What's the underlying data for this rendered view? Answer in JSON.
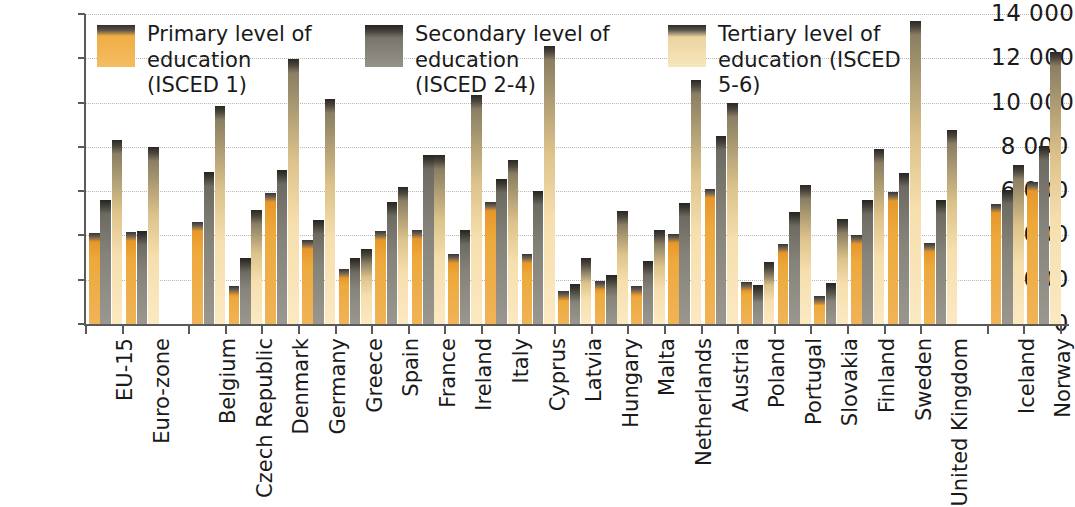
{
  "chart_data": {
    "type": "bar",
    "title": "",
    "subtitle": "",
    "xlabel": "",
    "ylabel": "",
    "ylim": [
      0,
      14000
    ],
    "ytick_step": 2000,
    "ytick_labels": [
      "0",
      "2 000",
      "4 000",
      "6 000",
      "8 000",
      "10 000",
      "12 000",
      "14 000"
    ],
    "ytick_values": [
      0,
      2000,
      4000,
      6000,
      8000,
      10000,
      12000,
      14000
    ],
    "grid": true,
    "legend_position": "top",
    "categories": [
      "EU-15",
      "Euro-zone",
      "Belgium",
      "Czech Republic",
      "Denmark",
      "Germany",
      "Greece",
      "Spain",
      "France",
      "Ireland",
      "Italy",
      "Cyprus",
      "Latvia",
      "Hungary",
      "Malta",
      "Netherlands",
      "Austria",
      "Poland",
      "Portugal",
      "Slovakia",
      "Finland",
      "Sweden",
      "United Kingdom",
      "Iceland",
      "Norway"
    ],
    "group_breaks_after": [
      "Euro-zone",
      "United Kingdom"
    ],
    "series": [
      {
        "name": "Primary level of education (ISCED 1)",
        "key": "primary",
        "color": "#eda93c",
        "values": [
          4100,
          4150,
          4600,
          1700,
          5900,
          3800,
          2500,
          4200,
          4250,
          3150,
          5500,
          3150,
          1500,
          1950,
          1700,
          4050,
          6100,
          1900,
          3600,
          1250,
          4000,
          5950,
          3650,
          5400,
          6400
        ]
      },
      {
        "name": "Secondary level of education (ISCED 2-4)",
        "key": "secondary",
        "color": "#85837a",
        "values": [
          5600,
          4200,
          6850,
          3000,
          6950,
          4700,
          3000,
          5500,
          7650,
          4250,
          6550,
          6000,
          1800,
          2200,
          2850,
          5450,
          8500,
          1750,
          5050,
          1850,
          5600,
          6800,
          5600,
          6050,
          8050
        ]
      },
      {
        "name": "Tertiary level of education (ISCED 5-6)",
        "key": "tertiary",
        "color": "#f6dfae",
        "values": [
          8300,
          8000,
          9850,
          5150,
          11950,
          10150,
          3400,
          6200,
          7650,
          10350,
          7400,
          12550,
          3000,
          5100,
          4250,
          11000,
          10000,
          2800,
          6300,
          4750,
          7900,
          13700,
          8750,
          7200,
          12300
        ]
      }
    ]
  },
  "legend": {
    "items": [
      {
        "label": "Primary level of\neducation (ISCED 1)",
        "swatch": "primary"
      },
      {
        "label": "Secondary level of education\n(ISCED 2-4)",
        "swatch": "secondary"
      },
      {
        "label": "Tertiary level of\neducation (ISCED 5-6)",
        "swatch": "tertiary"
      }
    ]
  }
}
